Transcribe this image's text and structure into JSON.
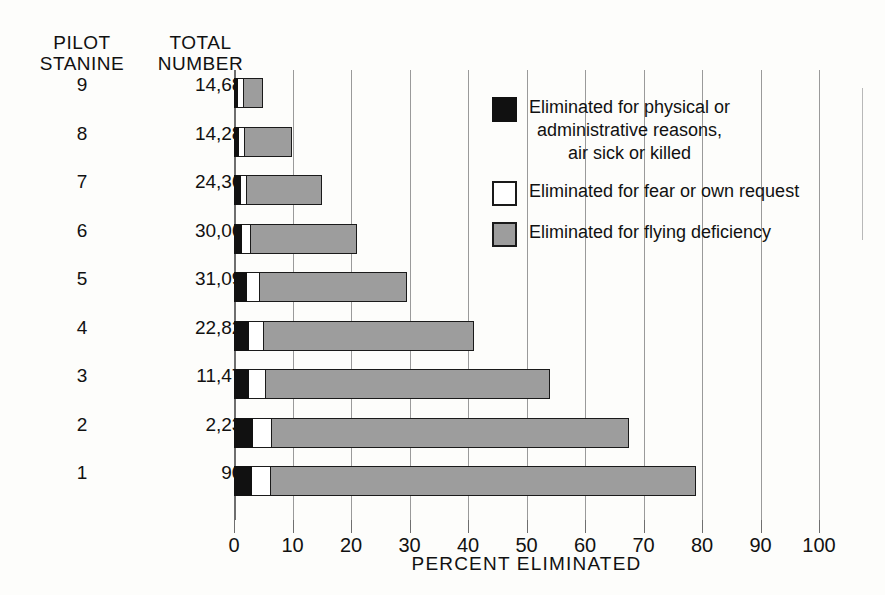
{
  "headers": {
    "stanine": "PILOT\nSTANINE",
    "total": "TOTAL\nNUMBER"
  },
  "axis": {
    "title": "PERCENT ELIMINATED",
    "ticks": [
      "0",
      "10",
      "20",
      "30",
      "40",
      "50",
      "60",
      "70",
      "80",
      "90",
      "100"
    ],
    "min": 0,
    "max": 100
  },
  "legend": {
    "items": [
      {
        "label": "Eliminated for physical or\nadministrative reasons,\nair sick or killed",
        "color": "#111111",
        "swatch": "black"
      },
      {
        "label": "Eliminated for fear or own request",
        "color": "#ffffff",
        "swatch": "white"
      },
      {
        "label": "Eliminated for flying deficiency",
        "color": "#9d9d9d",
        "swatch": "gray"
      }
    ]
  },
  "rows": [
    {
      "stanine": "9",
      "total": "14,682"
    },
    {
      "stanine": "8",
      "total": "14,286"
    },
    {
      "stanine": "7",
      "total": "24,367"
    },
    {
      "stanine": "6",
      "total": "30,066"
    },
    {
      "stanine": "5",
      "total": "31,091"
    },
    {
      "stanine": "4",
      "total": "22,827"
    },
    {
      "stanine": "3",
      "total": "11,471"
    },
    {
      "stanine": "2",
      "total": "2,239"
    },
    {
      "stanine": "1",
      "total": "904"
    }
  ],
  "chart_data": {
    "type": "bar",
    "orientation": "horizontal",
    "title": "",
    "xlabel": "PERCENT ELIMINATED",
    "ylabel": "PILOT STANINE",
    "xlim": [
      0,
      100
    ],
    "grid": true,
    "legend_position": "upper-right",
    "categories": [
      "9",
      "8",
      "7",
      "6",
      "5",
      "4",
      "3",
      "2",
      "1"
    ],
    "category_totals": [
      "14,682",
      "14,286",
      "24,367",
      "30,066",
      "31,091",
      "22,827",
      "11,471",
      "2,239",
      "904"
    ],
    "series": [
      {
        "name": "Eliminated for physical or administrative reasons, air sick or killed",
        "color": "#111111",
        "values": [
          0.7,
          0.8,
          1.2,
          1.3,
          2.3,
          2.5,
          2.6,
          3.3,
          3.0
        ]
      },
      {
        "name": "Eliminated for fear or own request",
        "color": "#ffffff",
        "values": [
          1.0,
          1.0,
          1.1,
          1.6,
          2.2,
          2.6,
          2.9,
          3.2,
          3.3
        ]
      },
      {
        "name": "Eliminated for flying deficiency",
        "color": "#9d9d9d",
        "values": [
          3.3,
          8.1,
          12.7,
          18.1,
          25.0,
          35.9,
          48.5,
          61.1,
          72.7
        ]
      }
    ],
    "totals_percent": [
      5.0,
      9.9,
      15.0,
      21.0,
      29.5,
      41.0,
      54.0,
      67.6,
      79.0
    ]
  }
}
